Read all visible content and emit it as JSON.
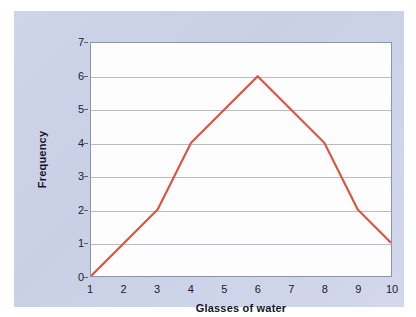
{
  "figure": {
    "panel_color": "#ced4ea",
    "plot_background": "#fdfdfe",
    "frame_color": "#8c93ad",
    "gridline_color": "#b9bcc6"
  },
  "chart_data": {
    "type": "line",
    "title": "",
    "subtitle": "",
    "xlabel": "Glasses of water",
    "ylabel": "Frequency",
    "x": [
      1,
      2,
      3,
      4,
      5,
      6,
      7,
      8,
      9,
      10
    ],
    "values": [
      0,
      1,
      2,
      4,
      5,
      6,
      5,
      4,
      2,
      1
    ],
    "vertices": [
      {
        "x": 1,
        "y": 0
      },
      {
        "x": 3,
        "y": 2
      },
      {
        "x": 4,
        "y": 4
      },
      {
        "x": 6,
        "y": 6
      },
      {
        "x": 8,
        "y": 4
      },
      {
        "x": 9,
        "y": 2
      },
      {
        "x": 10,
        "y": 1
      }
    ],
    "series": [
      {
        "name": "Frequency",
        "color": "#e0503c",
        "values": [
          0,
          1,
          2,
          4,
          5,
          6,
          5,
          4,
          2,
          1
        ]
      }
    ],
    "xticks": [
      "1",
      "2",
      "3",
      "4",
      "5",
      "6",
      "7",
      "8",
      "9",
      "10"
    ],
    "yticks": [
      "0",
      "1",
      "2",
      "3",
      "4",
      "5",
      "6",
      "7"
    ],
    "xlim": [
      1,
      10
    ],
    "ylim": [
      0,
      7
    ],
    "grid": "horizontal",
    "legend": "none",
    "line_color": "#e0503c",
    "line_width": 2.2
  }
}
